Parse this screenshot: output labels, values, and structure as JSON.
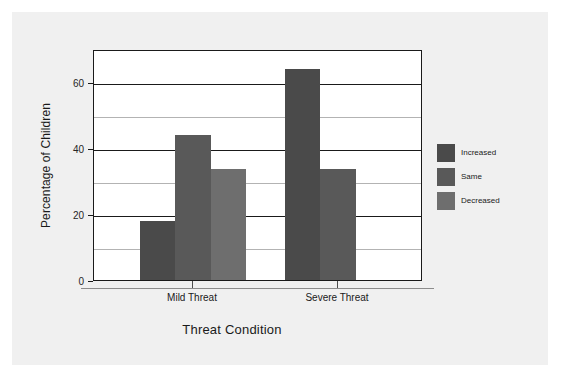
{
  "figure": {
    "background_color": "#f0f0f0",
    "plot_background_color": "#ffffff",
    "frame_color": "#1a1a1a"
  },
  "chart_data": {
    "type": "bar",
    "title": "",
    "subtitle": "",
    "xlabel": "Threat Condition",
    "ylabel": "Percentage of Children",
    "categories": [
      "Mild Threat",
      "Severe Threat"
    ],
    "series": [
      {
        "name": "Increased",
        "color": "#4a4a4a",
        "values": [
          18,
          64
        ]
      },
      {
        "name": "Same",
        "color": "#595959",
        "values": [
          44,
          33.5
        ]
      },
      {
        "name": "Decreased",
        "color": "#6e6e6e",
        "values": [
          33.5,
          0
        ]
      }
    ],
    "ylim": [
      0,
      70
    ],
    "yticks": [
      0,
      20,
      40,
      60
    ],
    "ytick_labels": [
      "0",
      "20",
      "40",
      "60"
    ],
    "minor_gridlines": [
      10,
      30,
      50
    ],
    "grid": true,
    "legend_position": "right-outside",
    "legend_entries": [
      "Increased",
      "Same",
      "Decreased"
    ]
  },
  "axes": {
    "y_ticks": [
      {
        "value": 0,
        "label": "0"
      },
      {
        "value": 20,
        "label": "20"
      },
      {
        "value": 40,
        "label": "40"
      },
      {
        "value": 60,
        "label": "60"
      }
    ],
    "x_ticks": [
      {
        "label": "Mild Threat"
      },
      {
        "label": "Severe Threat"
      }
    ]
  },
  "legend": {
    "items": [
      {
        "label": "Increased",
        "color": "#4a4a4a"
      },
      {
        "label": "Same",
        "color": "#595959"
      },
      {
        "label": "Decreased",
        "color": "#6e6e6e"
      }
    ]
  }
}
